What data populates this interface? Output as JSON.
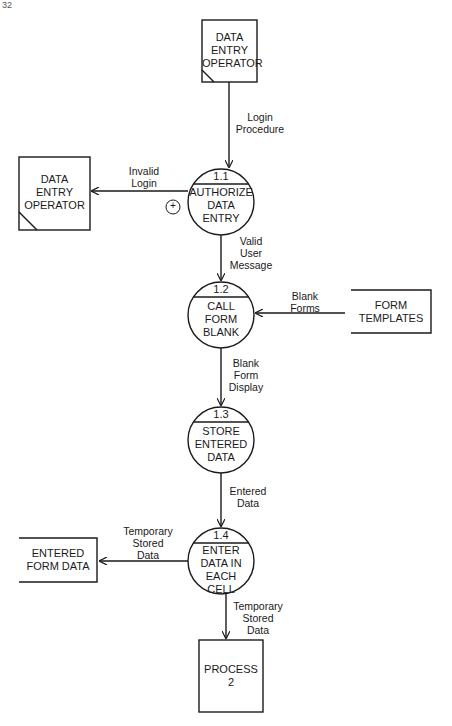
{
  "page": {
    "number": "32"
  },
  "external_entities": {
    "operator_top": {
      "label": "DATA\nENTRY\nOPERATOR"
    },
    "operator_left": {
      "label": "DATA\nENTRY\nOPERATOR"
    },
    "process2": {
      "label": "PROCESS\n2"
    }
  },
  "data_stores": {
    "form_templates": {
      "label": "FORM\nTEMPLATES"
    },
    "entered_form_data": {
      "label": "ENTERED\nFORM DATA"
    }
  },
  "processes": [
    {
      "id": "1.1",
      "label": "AUTHORIZE\nDATA\nENTRY"
    },
    {
      "id": "1.2",
      "label": "CALL\nFORM\nBLANK"
    },
    {
      "id": "1.3",
      "label": "STORE\nENTERED\nDATA"
    },
    {
      "id": "1.4",
      "label": "ENTER\nDATA IN\nEACH\nCELL"
    }
  ],
  "flows": {
    "login_procedure": "Login\nProcedure",
    "invalid_login": "Invalid\nLogin",
    "valid_user_message": "Valid\nUser\nMessage",
    "blank_forms": "Blank\nForms",
    "blank_form_display": "Blank\nForm\nDisplay",
    "entered_data": "Entered\nData",
    "temp_stored_left": "Temporary\nStored\nData",
    "temp_stored_down": "Temporary\nStored\nData"
  },
  "symbols": {
    "or_connector": "+"
  }
}
